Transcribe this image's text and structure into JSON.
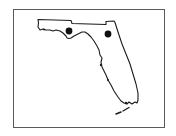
{
  "map": {
    "region": "Florida",
    "style": "black outline on white",
    "frame": {
      "border_color": "#5a5a5a",
      "background": "#ffffff"
    },
    "outline_color": "#1a1a1a",
    "markers": [
      {
        "id": "marker-1",
        "label": "",
        "cx": 69,
        "cy": 31,
        "r": 3.4,
        "color": "#111111"
      },
      {
        "id": "marker-2",
        "label": "",
        "cx": 108,
        "cy": 34,
        "r": 3.4,
        "color": "#111111"
      }
    ]
  }
}
